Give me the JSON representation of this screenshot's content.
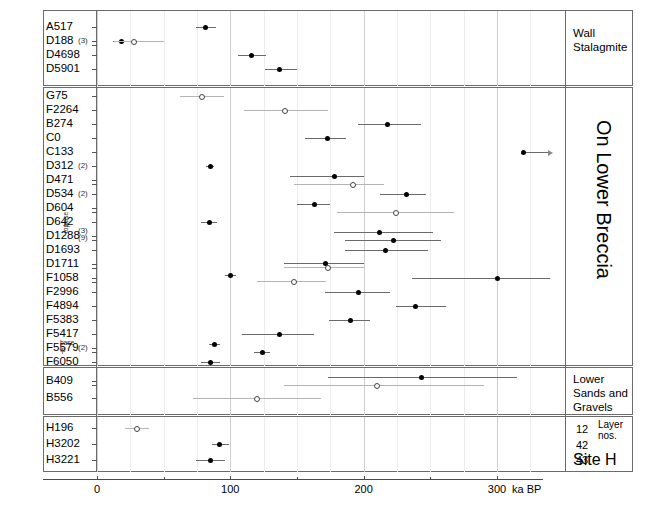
{
  "figure": {
    "type": "dot-plot-with-error-bars",
    "axis": {
      "xlabel": "ka BP",
      "xlim": [
        -8,
        340
      ],
      "ticks_major": [
        0,
        100,
        200,
        300
      ],
      "ticks_major_labels": [
        "0",
        "100",
        "200",
        "300"
      ],
      "ticks_minor": [
        50,
        150,
        250
      ],
      "grid": "vertical-light"
    },
    "panels": [
      {
        "id": "wall-stalagmite",
        "right_label": "Wall\nStalagmite",
        "rows": [
          "A517",
          "D188",
          "D4698",
          "D5901"
        ]
      },
      {
        "id": "on-lower-breccia",
        "right_label": "On Lower Breccia",
        "rows": [
          "G75",
          "F2264",
          "B274",
          "C0",
          "C133",
          "D312",
          "D471",
          "D534",
          "D604",
          "D642",
          "D1288",
          "D1693",
          "D1711",
          "F1058",
          "F2996",
          "F4894",
          "F5383",
          "F5417",
          "F5579",
          "F6050"
        ]
      },
      {
        "id": "lower-sands-gravels",
        "right_label": "Lower\nSands and\nGravels",
        "rows": [
          "B409",
          "B556"
        ]
      },
      {
        "id": "site-h",
        "right_label": "Site H",
        "layer_header": "Layer\nnos.",
        "layers": [
          "12",
          "42",
          "43"
        ],
        "rows": [
          "H196",
          "H3202",
          "H3221"
        ]
      }
    ],
    "annotations": [
      {
        "row": "D188",
        "text": "(3)"
      },
      {
        "row": "D312",
        "text": "(2)"
      },
      {
        "row": "D534",
        "text": "(2)"
      },
      {
        "row": "D1288",
        "text": "(3)"
      },
      {
        "row": "D1288",
        "text": "(9)"
      },
      {
        "row": "D1288",
        "text": "base"
      },
      {
        "row": "D1288",
        "text": "top"
      },
      {
        "row": "F5579",
        "text": "(2)"
      },
      {
        "row": "F5579",
        "text": "base"
      },
      {
        "row": "F5579",
        "text": "tp"
      }
    ]
  },
  "chart_data": {
    "type": "scatter",
    "title": "",
    "xlabel": "ka BP",
    "ylabel": "",
    "xlim": [
      -8,
      340
    ],
    "xticks": [
      0,
      100,
      200,
      300
    ],
    "grid": true,
    "legend": "filled = closed symbol; open = open symbol",
    "categories": [
      "A517",
      "D188",
      "D4698",
      "D5901",
      "G75",
      "F2264",
      "B274",
      "C0",
      "C133",
      "D312",
      "D471",
      "D534",
      "D604",
      "D642",
      "D1288",
      "D1693",
      "D1711",
      "F1058",
      "F2996",
      "F4894",
      "F5383",
      "F5417",
      "F5579",
      "F6050",
      "B409",
      "B556",
      "H196",
      "H3202",
      "H3221"
    ],
    "points": [
      {
        "row": "A517",
        "x": 81,
        "lo": 74,
        "hi": 89,
        "fill": "closed"
      },
      {
        "row": "D188",
        "x": 18,
        "lo": 12,
        "hi": 23,
        "fill": "closed"
      },
      {
        "row": "D188",
        "x": 28,
        "lo": 13,
        "hi": 50,
        "fill": "open"
      },
      {
        "row": "D4698",
        "x": 116,
        "lo": 106,
        "hi": 127,
        "fill": "closed"
      },
      {
        "row": "D5901",
        "x": 137,
        "lo": 126,
        "hi": 150,
        "fill": "closed"
      },
      {
        "row": "G75",
        "x": 79,
        "lo": 62,
        "hi": 95,
        "fill": "open"
      },
      {
        "row": "F2264",
        "x": 141,
        "lo": 110,
        "hi": 173,
        "fill": "open"
      },
      {
        "row": "B274",
        "x": 218,
        "lo": 196,
        "hi": 243,
        "fill": "closed"
      },
      {
        "row": "C0",
        "x": 173,
        "lo": 156,
        "hi": 187,
        "fill": "closed"
      },
      {
        "row": "C133",
        "x": 320,
        "lo": 320,
        "hi": 340,
        "fill": "closed",
        "arrow": true
      },
      {
        "row": "D312",
        "x": 85,
        "lo": 82,
        "hi": 88,
        "fill": "closed"
      },
      {
        "row": "D471",
        "x": 178,
        "lo": 145,
        "hi": 200,
        "fill": "closed"
      },
      {
        "row": "D471",
        "x": 192,
        "lo": 148,
        "hi": 215,
        "fill": "open"
      },
      {
        "row": "D534",
        "x": 232,
        "lo": 212,
        "hi": 247,
        "fill": "closed"
      },
      {
        "row": "D604",
        "x": 163,
        "lo": 150,
        "hi": 175,
        "fill": "closed"
      },
      {
        "row": "D604",
        "x": 224,
        "lo": 180,
        "hi": 268,
        "fill": "open"
      },
      {
        "row": "D642",
        "x": 84,
        "lo": 78,
        "hi": 90,
        "fill": "closed"
      },
      {
        "row": "D1288",
        "x": 212,
        "lo": 178,
        "hi": 252,
        "fill": "closed"
      },
      {
        "row": "D1288",
        "x": 222,
        "lo": 186,
        "hi": 258,
        "fill": "closed"
      },
      {
        "row": "D1693",
        "x": 216,
        "lo": 186,
        "hi": 248,
        "fill": "closed"
      },
      {
        "row": "D1711",
        "x": 171,
        "lo": 140,
        "hi": 200,
        "fill": "closed"
      },
      {
        "row": "D1711",
        "x": 173,
        "lo": 140,
        "hi": 200,
        "fill": "open"
      },
      {
        "row": "F1058",
        "x": 100,
        "lo": 96,
        "hi": 104,
        "fill": "closed"
      },
      {
        "row": "F1058",
        "x": 148,
        "lo": 120,
        "hi": 172,
        "fill": "open"
      },
      {
        "row": "F1058",
        "x": 300,
        "lo": 236,
        "hi": 340,
        "fill": "closed"
      },
      {
        "row": "F2996",
        "x": 196,
        "lo": 171,
        "hi": 220,
        "fill": "closed"
      },
      {
        "row": "F4894",
        "x": 239,
        "lo": 224,
        "hi": 262,
        "fill": "closed"
      },
      {
        "row": "F5383",
        "x": 190,
        "lo": 174,
        "hi": 205,
        "fill": "closed"
      },
      {
        "row": "F5417",
        "x": 137,
        "lo": 109,
        "hi": 163,
        "fill": "closed"
      },
      {
        "row": "F5579",
        "x": 88,
        "lo": 84,
        "hi": 92,
        "fill": "closed"
      },
      {
        "row": "F5579",
        "x": 124,
        "lo": 118,
        "hi": 130,
        "fill": "closed"
      },
      {
        "row": "F6050",
        "x": 85,
        "lo": 78,
        "hi": 92,
        "fill": "closed"
      },
      {
        "row": "B409",
        "x": 210,
        "lo": 140,
        "hi": 290,
        "fill": "open"
      },
      {
        "row": "B409",
        "x": 243,
        "lo": 173,
        "hi": 315,
        "fill": "closed"
      },
      {
        "row": "B556",
        "x": 120,
        "lo": 72,
        "hi": 168,
        "fill": "open"
      },
      {
        "row": "H196",
        "x": 30,
        "lo": 21,
        "hi": 39,
        "fill": "open"
      },
      {
        "row": "H3202",
        "x": 92,
        "lo": 86,
        "hi": 99,
        "fill": "closed"
      },
      {
        "row": "H3221",
        "x": 85,
        "lo": 74,
        "hi": 96,
        "fill": "closed"
      }
    ]
  }
}
